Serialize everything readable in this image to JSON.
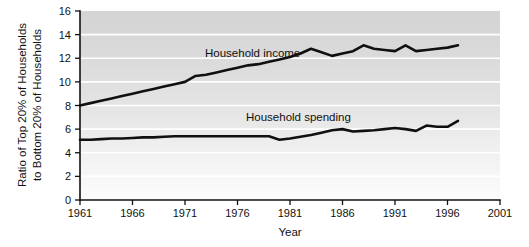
{
  "chart_data": {
    "type": "line",
    "title": "",
    "xlabel": "Year",
    "ylabel": "Ratio of Top 20% of Households to Bottom 20% of Households",
    "ylabel_line1": "Ratio of Top 20% of Households",
    "ylabel_line2": "to Bottom 20% of Households",
    "xlim": [
      1961,
      2001
    ],
    "ylim": [
      0,
      16
    ],
    "grid": true,
    "gridlines_y": [
      2,
      4,
      6,
      8,
      10,
      12,
      14
    ],
    "legend_position": "inline-annotation",
    "xticks": [
      "1961",
      "1966",
      "1971",
      "1976",
      "1981",
      "1986",
      "1991",
      "1996",
      "2001"
    ],
    "xtick_values": [
      1961,
      1966,
      1971,
      1976,
      1981,
      1986,
      1991,
      1996,
      2001
    ],
    "yticks": [
      "0",
      "2",
      "4",
      "6",
      "8",
      "10",
      "12",
      "14",
      "16"
    ],
    "ytick_values": [
      0,
      2,
      4,
      6,
      8,
      10,
      12,
      14,
      16
    ],
    "x": [
      1961,
      1962,
      1963,
      1964,
      1965,
      1966,
      1967,
      1968,
      1969,
      1970,
      1971,
      1972,
      1973,
      1974,
      1975,
      1976,
      1977,
      1978,
      1979,
      1980,
      1981,
      1982,
      1983,
      1984,
      1985,
      1986,
      1987,
      1988,
      1989,
      1990,
      1991,
      1992,
      1993,
      1994,
      1995,
      1996,
      1997
    ],
    "series": [
      {
        "name": "Household income",
        "label": "Household income",
        "color": "#101010",
        "values": [
          8.0,
          8.2,
          8.4,
          8.6,
          8.8,
          9.0,
          9.2,
          9.4,
          9.6,
          9.8,
          10.0,
          10.5,
          10.6,
          10.8,
          11.0,
          11.2,
          11.4,
          11.5,
          11.7,
          11.9,
          12.1,
          12.4,
          12.8,
          12.5,
          12.2,
          12.4,
          12.6,
          13.1,
          12.8,
          12.7,
          12.6,
          13.1,
          12.6,
          12.7,
          12.8,
          12.9,
          13.1
        ]
      },
      {
        "name": "Household spending",
        "label": "Household spending",
        "color": "#101010",
        "values": [
          5.1,
          5.1,
          5.15,
          5.2,
          5.2,
          5.25,
          5.3,
          5.3,
          5.35,
          5.4,
          5.4,
          5.4,
          5.4,
          5.4,
          5.4,
          5.4,
          5.4,
          5.4,
          5.4,
          5.1,
          5.2,
          5.35,
          5.5,
          5.7,
          5.9,
          6.0,
          5.8,
          5.85,
          5.9,
          6.0,
          6.1,
          6.0,
          5.85,
          6.3,
          6.2,
          6.2,
          6.7
        ]
      }
    ],
    "annotations": [
      {
        "text": "Household income",
        "x_px": 205,
        "y_px": 57
      },
      {
        "text": "Household spending",
        "x_px": 246,
        "y_px": 121
      }
    ],
    "colors": {
      "plot_bg_top": "#d5d5d5",
      "plot_bg_bottom": "#fbfbfb",
      "gridline": "#ffffff",
      "axis": "#111111",
      "line": "#101010",
      "page_bg": "#ffffff"
    }
  }
}
